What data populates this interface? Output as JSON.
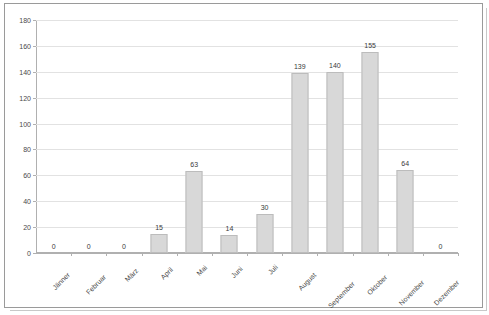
{
  "chart_data": {
    "type": "bar",
    "title": "",
    "subtitle": "",
    "xlabel": "",
    "ylabel": "",
    "categories": [
      "Jänner",
      "Februar",
      "März",
      "April",
      "Mai",
      "Juni",
      "Juli",
      "August",
      "September",
      "Oktober",
      "November",
      "Dezember"
    ],
    "values": [
      0,
      0,
      0,
      15,
      63,
      14,
      30,
      139,
      140,
      155,
      64,
      0
    ],
    "data_labels": [
      "0",
      "0",
      "0",
      "15",
      "63",
      "14",
      "30",
      "139",
      "140",
      "155",
      "64",
      "0"
    ],
    "ylim": [
      0,
      180
    ],
    "ytick_step": 20,
    "yticks": [
      0,
      20,
      40,
      60,
      80,
      100,
      120,
      140,
      160,
      180
    ],
    "ytick_labels": [
      "0",
      "20",
      "40",
      "60",
      "80",
      "100",
      "120",
      "140",
      "160",
      "180"
    ],
    "grid": {
      "horizontal": true,
      "vertical": false,
      "color": "#e2e2e2"
    },
    "legend": {
      "visible": false,
      "position": "none",
      "entries": []
    },
    "series": [
      {
        "name": "",
        "values": [
          0,
          0,
          0,
          15,
          63,
          14,
          30,
          139,
          140,
          155,
          64,
          0
        ]
      }
    ],
    "colors": {
      "bar_fill": "#d8d8d8",
      "bar_border": "#bcbcbc",
      "axis": "#b0b0b0",
      "gridline": "#e2e2e2",
      "text": "#4a4a4a",
      "frame": "#9a9a9a",
      "background": "#ffffff"
    },
    "xlabel_rotation_degrees": -45
  }
}
